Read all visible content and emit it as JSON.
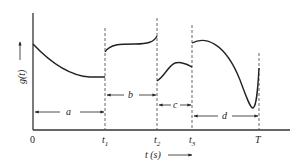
{
  "diagram": {
    "y_axis_label": "g(t)",
    "x_axis_label": "t (s)",
    "origin_label": "0",
    "ticks": [
      {
        "label": "t",
        "sub": "1"
      },
      {
        "label": "t",
        "sub": "2"
      },
      {
        "label": "t",
        "sub": "3"
      },
      {
        "label": "T",
        "sub": ""
      }
    ],
    "segments": [
      {
        "label": "a"
      },
      {
        "label": "b"
      },
      {
        "label": "c"
      },
      {
        "label": "d"
      }
    ],
    "colors": {
      "line": "#222222",
      "axis": "#333333",
      "dashed": "#555555"
    }
  }
}
